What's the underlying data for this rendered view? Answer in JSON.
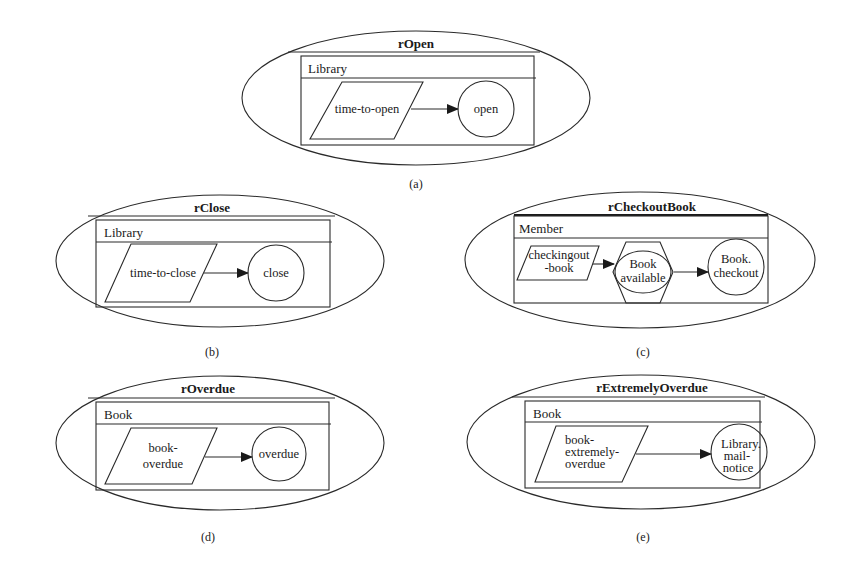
{
  "diagrams": [
    {
      "id": "a",
      "title": "rOpen",
      "class_label": "Library",
      "caption": "(a)",
      "event": [
        "time-to-open"
      ],
      "target": [
        "open"
      ]
    },
    {
      "id": "b",
      "title": "rClose",
      "class_label": "Library",
      "caption": "(b)",
      "event": [
        "time-to-close"
      ],
      "target": [
        "close"
      ]
    },
    {
      "id": "c",
      "title": "rCheckoutBook",
      "class_label": "Member",
      "caption": "(c)",
      "event": [
        "checkingout",
        "-book"
      ],
      "condition": [
        "Book",
        "available"
      ],
      "target": [
        "Book.",
        "checkout"
      ]
    },
    {
      "id": "d",
      "title": "rOverdue",
      "class_label": "Book",
      "caption": "(d)",
      "event": [
        "book-",
        "overdue"
      ],
      "target": [
        "overdue"
      ]
    },
    {
      "id": "e",
      "title": "rExtremelyOverdue",
      "class_label": "Book",
      "caption": "(e)",
      "event": [
        "book-",
        "extremely-",
        "overdue"
      ],
      "target": [
        "Library.",
        "mail-",
        "notice"
      ]
    }
  ],
  "legend_shapes": {
    "event": "parallelogram",
    "condition": "hexagon",
    "action": "circle"
  },
  "colors": {
    "line": "#2a2a2a",
    "background": "#ffffff"
  }
}
